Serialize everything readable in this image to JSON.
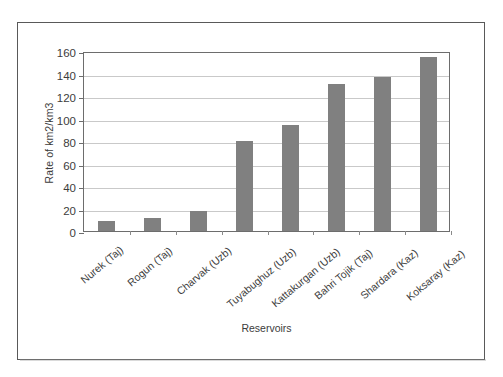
{
  "chart_data": {
    "type": "bar",
    "title": "",
    "subtitle": "",
    "xlabel": "Reservoirs",
    "ylabel": "Rate of km2/km3",
    "categories": [
      "Nurek (Taj)",
      "Rogun (Taj)",
      "Charvak (Uzb)",
      "Tuyabughuz (Uzb)",
      "Kattakurgan (Uzb)",
      "Bahri Tojik (Taj)",
      "Shardara (Kaz)",
      "Koksaray (Kaz)"
    ],
    "values": [
      9,
      12,
      18,
      80,
      94,
      131,
      137,
      155
    ],
    "ylim": [
      0,
      160
    ],
    "ytick_labels": [
      "0",
      "20",
      "40",
      "60",
      "80",
      "100",
      "120",
      "140",
      "160"
    ],
    "ytick_values": [
      0,
      20,
      40,
      60,
      80,
      100,
      120,
      140,
      160
    ],
    "grid": "horizontal",
    "legend": "none",
    "bar_color": "#808080",
    "gridline_color": "#c9c9c9",
    "axis_color": "#6d6d6d",
    "background_color": "#ffffff"
  },
  "figure": {
    "border_color": "#595959"
  }
}
